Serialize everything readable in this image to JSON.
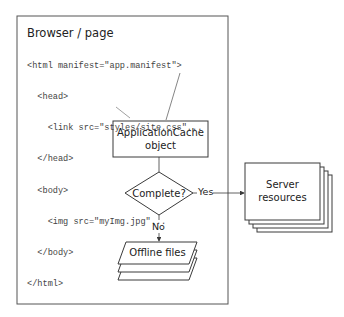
{
  "browser_page": {
    "title": "Browser / page",
    "code_lines": [
      "<html manifest=\"app.manifest\">",
      "  <head>",
      "    <link src=\"styles/site.css\"...",
      "  </head>",
      "  <body>",
      "    <img src=\"myImg.jpg\"...",
      "  </body>",
      "</html>"
    ]
  },
  "nodes": {
    "appcache": {
      "line1": "ApplicationCache",
      "line2": "object"
    },
    "decision": {
      "label": "Complete?"
    },
    "server": {
      "line1": "Server",
      "line2": "resources"
    },
    "offline": {
      "label": "Offline files"
    }
  },
  "edges": {
    "yes_label": "Yes",
    "no_label": "No"
  },
  "colors": {
    "stroke": "#3a3a3a",
    "text": "#222222",
    "code_text": "#444444",
    "background": "#ffffff"
  }
}
